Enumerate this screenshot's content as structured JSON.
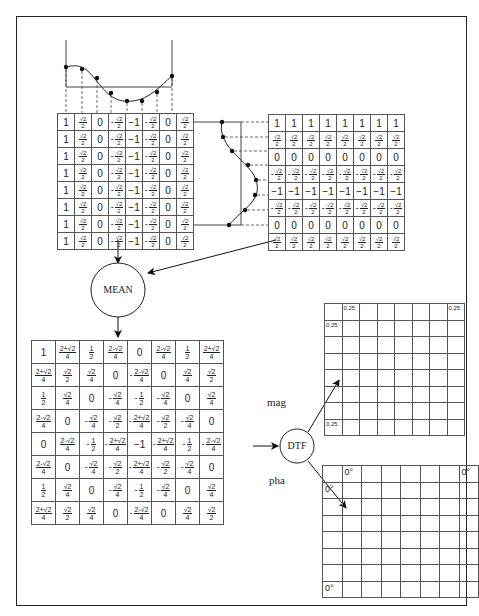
{
  "diagram": {
    "title": "",
    "nodes": {
      "mean": "MEAN",
      "dtf": "DTF"
    },
    "edge_labels": {
      "mag": "mag",
      "pha": "pha"
    },
    "horizontal_basis": {
      "description": "cosine sampled horizontally at 8 points",
      "row_values": [
        "1",
        "√2/2",
        "0",
        "-√2/2",
        "-1",
        "-√2/2",
        "0",
        "√2/2"
      ],
      "rows": 8
    },
    "vertical_basis": {
      "description": "cosine sampled vertically at 8 points",
      "column_values": [
        "1",
        "√2/2",
        "0",
        "-√2/2",
        "-1",
        "-√2/2",
        "0",
        "√2/2"
      ],
      "cols": 8
    },
    "mean_matrix": [
      [
        "1",
        "(2+√2)/4",
        "1/2",
        "(2-√2)/4",
        "0",
        "(2-√2)/4",
        "1/2",
        "(2+√2)/4"
      ],
      [
        "(2+√2)/4",
        "√2/2",
        "√2/4",
        "0",
        "-(2-√2)/4",
        "0",
        "√2/4",
        "√2/2"
      ],
      [
        "1/2",
        "√2/4",
        "0",
        "-√2/4",
        "-1/2",
        "-√2/4",
        "0",
        "√2/4"
      ],
      [
        "(2-√2)/4",
        "0",
        "-√2/4",
        "-√2/2",
        "-(2+√2)/4",
        "-√2/2",
        "-√2/4",
        "0"
      ],
      [
        "0",
        "(2-√2)/4",
        "-1/2",
        "-(2+√2)/4",
        "-1",
        "-(2+√2)/4",
        "-1/2",
        "-(2-√2)/4"
      ],
      [
        "(2-√2)/4",
        "0",
        "-√2/4",
        "-√2/2",
        "-(2+√2)/4",
        "-√2/2",
        "-√2/4",
        "0"
      ],
      [
        "1/2",
        "√2/4",
        "0",
        "-√2/4",
        "-1/2",
        "-√2/4",
        "0",
        "√2/4"
      ],
      [
        "(2+√2)/4",
        "√2/2",
        "√2/4",
        "0",
        "-(2-√2)/4",
        "0",
        "√2/4",
        "√2/2"
      ]
    ],
    "magnitude_grid": {
      "size": 8,
      "cells": [
        {
          "row": 0,
          "col": 1,
          "value": "0,25"
        },
        {
          "row": 0,
          "col": 7,
          "value": "0,25"
        },
        {
          "row": 1,
          "col": 0,
          "value": "0,25"
        },
        {
          "row": 7,
          "col": 0,
          "value": "0,25"
        }
      ]
    },
    "phase_grid": {
      "size": 8,
      "cells": [
        {
          "row": 0,
          "col": 1,
          "value": "0°"
        },
        {
          "row": 0,
          "col": 7,
          "value": "0°"
        },
        {
          "row": 1,
          "col": 0,
          "value": "0°"
        },
        {
          "row": 7,
          "col": 0,
          "value": "0°"
        }
      ]
    }
  }
}
